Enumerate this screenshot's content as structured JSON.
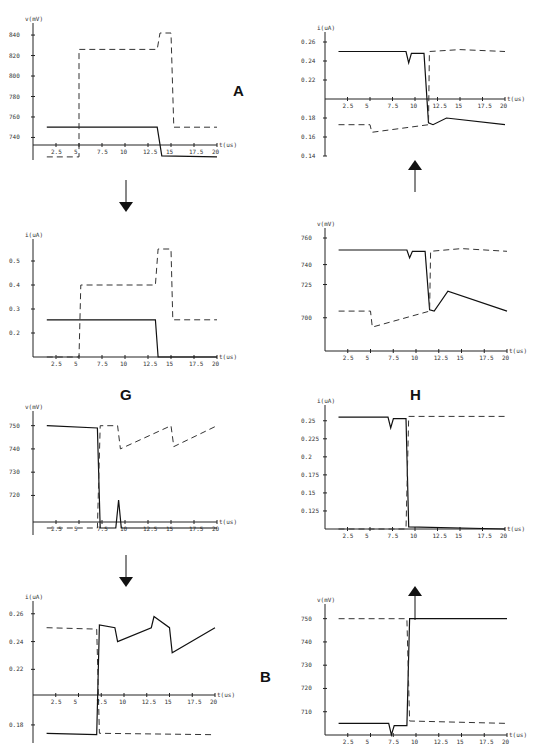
{
  "labels": {
    "A": "A",
    "G": "G",
    "H": "H",
    "B": "B"
  },
  "chart_data": [
    {
      "type": "line",
      "panel": "top-left",
      "ylabel": "v(mV)",
      "xlabel": "t(us)",
      "yticks": [
        740,
        760,
        780,
        800,
        820,
        840
      ],
      "xticks": [
        2.5,
        5,
        7.5,
        10,
        12.5,
        15,
        17.5,
        20
      ],
      "series": [
        {
          "name": "solid",
          "style": "solid",
          "x": [
            1.5,
            12,
            13.5,
            14,
            20
          ],
          "y": [
            750,
            750,
            750,
            722,
            721
          ]
        },
        {
          "name": "dashed",
          "style": "dashed",
          "x": [
            1.5,
            5,
            5,
            13.5,
            13.8,
            15,
            15.3,
            20
          ],
          "y": [
            721,
            721,
            826,
            826,
            842,
            842,
            750,
            750
          ]
        }
      ]
    },
    {
      "type": "line",
      "panel": "top-right",
      "ylabel": "i(uA)",
      "xlabel": "t(us)",
      "yticks": [
        0.14,
        0.16,
        0.18,
        0.22,
        0.24,
        0.26
      ],
      "xticks": [
        2.5,
        5,
        7.5,
        10,
        12.5,
        15,
        17.5,
        20
      ],
      "series": [
        {
          "name": "solid",
          "style": "solid",
          "x": [
            1.5,
            9,
            9.3,
            9.6,
            11,
            11.5,
            12,
            13.5,
            20
          ],
          "y": [
            0.25,
            0.25,
            0.238,
            0.248,
            0.248,
            0.175,
            0.173,
            0.18,
            0.173
          ]
        },
        {
          "name": "dashed",
          "style": "dashed",
          "x": [
            1.5,
            5,
            5.2,
            11.5,
            11.6,
            15,
            20
          ],
          "y": [
            0.173,
            0.173,
            0.165,
            0.173,
            0.25,
            0.252,
            0.25
          ]
        }
      ]
    },
    {
      "type": "line",
      "panel": "mid-left",
      "ylabel": "i(uA)",
      "xlabel": "t(us)",
      "yticks": [
        0.2,
        0.3,
        0.4,
        0.5
      ],
      "xticks": [
        2.5,
        5,
        7.5,
        10,
        12.5,
        15,
        17.5,
        20
      ],
      "series": [
        {
          "name": "solid",
          "style": "solid",
          "x": [
            1.5,
            13.3,
            13.6,
            20
          ],
          "y": [
            0.255,
            0.255,
            0.1,
            0.1
          ]
        },
        {
          "name": "dashed",
          "style": "dashed",
          "x": [
            1.5,
            5,
            5.2,
            13.3,
            13.6,
            15,
            15.2,
            20
          ],
          "y": [
            0.1,
            0.1,
            0.4,
            0.4,
            0.55,
            0.55,
            0.255,
            0.255
          ]
        }
      ]
    },
    {
      "type": "line",
      "panel": "mid-right",
      "ylabel": "v(mV)",
      "xlabel": "t(us)",
      "yticks": [
        700,
        725,
        740,
        760
      ],
      "xticks": [
        2.5,
        5,
        7.5,
        10,
        12.5,
        15,
        17.5,
        20
      ],
      "series": [
        {
          "name": "solid",
          "style": "solid",
          "x": [
            1.5,
            9,
            9.3,
            9.6,
            11,
            11.5,
            12,
            13.5,
            20
          ],
          "y": [
            751,
            751,
            745,
            750,
            750,
            706,
            705,
            720,
            705
          ]
        },
        {
          "name": "dashed",
          "style": "dashed",
          "x": [
            1.5,
            5,
            5.2,
            11.5,
            11.6,
            15,
            20
          ],
          "y": [
            705,
            705,
            693,
            705,
            750,
            752,
            750
          ]
        }
      ]
    },
    {
      "type": "line",
      "panel": "lower-left",
      "ylabel": "v(mV)",
      "xlabel": "t(us)",
      "yticks": [
        720,
        730,
        740,
        750
      ],
      "xticks": [
        2.5,
        5,
        7.5,
        10,
        12.5,
        15,
        17.5,
        20
      ],
      "series": [
        {
          "name": "solid",
          "style": "solid",
          "x": [
            1.5,
            7,
            7.3,
            9,
            9.3,
            9.6,
            20
          ],
          "y": [
            750,
            749,
            706,
            706,
            718,
            706,
            706
          ]
        },
        {
          "name": "dashed",
          "style": "dashed",
          "x": [
            1.5,
            7,
            7.3,
            9.2,
            9.5,
            15,
            15.3,
            20
          ],
          "y": [
            706,
            706,
            750,
            750,
            740,
            750,
            741,
            750
          ]
        }
      ]
    },
    {
      "type": "line",
      "panel": "lower-right",
      "ylabel": "i(uA)",
      "xlabel": "t(us)",
      "yticks": [
        0.125,
        0.15,
        0.175,
        0.2,
        0.225,
        0.25
      ],
      "xticks": [
        2.5,
        5,
        7.5,
        10,
        12.5,
        15,
        17.5,
        20
      ],
      "series": [
        {
          "name": "solid",
          "style": "solid",
          "x": [
            1.5,
            7,
            7.3,
            7.6,
            9,
            9.3,
            20
          ],
          "y": [
            0.255,
            0.255,
            0.24,
            0.253,
            0.253,
            0.103,
            0.1
          ]
        },
        {
          "name": "dashed",
          "style": "dashed",
          "x": [
            1.5,
            9,
            9.3,
            20
          ],
          "y": [
            0.1,
            0.1,
            0.256,
            0.256
          ]
        }
      ]
    },
    {
      "type": "line",
      "panel": "bottom-left",
      "ylabel": "i(uA)",
      "xlabel": "t(us)",
      "yticks": [
        0.18,
        0.22,
        0.24,
        0.26
      ],
      "xticks": [
        2.5,
        5,
        7.5,
        10,
        12.5,
        15,
        17.5,
        20
      ],
      "series": [
        {
          "name": "solid",
          "style": "solid",
          "x": [
            1.5,
            7,
            7.3,
            9,
            9.3,
            13,
            13.3,
            15,
            15.3,
            20
          ],
          "y": [
            0.174,
            0.173,
            0.252,
            0.25,
            0.24,
            0.25,
            0.258,
            0.25,
            0.232,
            0.25
          ]
        },
        {
          "name": "dashed",
          "style": "dashed",
          "x": [
            1.5,
            7,
            7.3,
            20
          ],
          "y": [
            0.25,
            0.249,
            0.174,
            0.173
          ]
        }
      ]
    },
    {
      "type": "line",
      "panel": "bottom-right",
      "ylabel": "v(mV)",
      "xlabel": "t(us)",
      "yticks": [
        710,
        720,
        730,
        740,
        750
      ],
      "xticks": [
        2.5,
        5,
        7.5,
        10,
        12.5,
        15,
        17.5,
        20
      ],
      "series": [
        {
          "name": "solid",
          "style": "solid",
          "x": [
            1.5,
            7,
            7.3,
            7.6,
            9,
            9.3,
            20
          ],
          "y": [
            705,
            705,
            700,
            704,
            704,
            750,
            750
          ]
        },
        {
          "name": "dashed",
          "style": "dashed",
          "x": [
            1.5,
            9,
            9.3,
            20
          ],
          "y": [
            750,
            750,
            706,
            705
          ]
        }
      ]
    }
  ],
  "panel_layout": [
    {
      "id": "p1",
      "x0": 33,
      "x1": 215,
      "axisY": 145,
      "yTop": 22,
      "yBot": 160,
      "ticks": [
        [
          "840",
          33
        ],
        [
          "820",
          52
        ],
        [
          "800",
          71
        ],
        [
          "780",
          90
        ],
        [
          "760",
          108
        ],
        [
          "740",
          127
        ]
      ],
      "yl": "v(mV)",
      "tickLabels": [
        "2.5",
        "5",
        "7.5",
        "10",
        "12.5",
        "15",
        "17.5",
        "20"
      ]
    },
    {
      "id": "p2",
      "x0": 55,
      "x1": 235,
      "axisY": 99,
      "yTop": 22,
      "yBot": 158,
      "ticks": [
        [
          "0.26",
          42
        ],
        [
          "0.24",
          61
        ],
        [
          "0.22",
          80
        ],
        [
          "0.18",
          118
        ],
        [
          "0.16",
          137
        ],
        [
          "0.14",
          156
        ]
      ],
      "yl": "i(uA)",
      "tickLabels": [
        "2.5",
        "5",
        "7.5",
        "10",
        "12.5",
        "15",
        "17.5",
        "20"
      ]
    }
  ]
}
